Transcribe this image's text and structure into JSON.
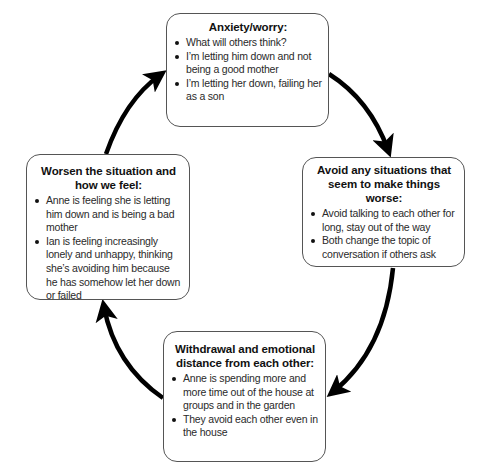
{
  "diagram": {
    "type": "cycle",
    "direction": "clockwise",
    "nodes": [
      {
        "id": "top",
        "title": "Anxiety/worry:",
        "bullets": [
          "What will others think?",
          "I’m letting him down and not being a good mother",
          "I’m letting her down, failing her as a son"
        ]
      },
      {
        "id": "right",
        "title": "Avoid any situations that seem to make things worse:",
        "bullets": [
          "Avoid talking to each other for long, stay out of the way",
          "Both change the topic of conversation if others ask"
        ]
      },
      {
        "id": "bottom",
        "title": "Withdrawal and emotional distance from each other:",
        "bullets": [
          "Anne is spending more and more time out of the house at groups and in the garden",
          "They avoid each other even in the house"
        ]
      },
      {
        "id": "left",
        "title": "Worsen the situation and how we feel:",
        "bullets": [
          "Anne is feeling she is letting him down and is being a bad mother",
          "Ian is feeling increasingly lonely and unhappy, thinking she’s avoiding him because he has somehow let her down or failed"
        ]
      }
    ],
    "edges": [
      {
        "from": "top",
        "to": "right"
      },
      {
        "from": "right",
        "to": "bottom"
      },
      {
        "from": "bottom",
        "to": "left"
      },
      {
        "from": "left",
        "to": "top"
      }
    ],
    "colors": {
      "arrow": "#000000",
      "box_border": "#555555",
      "background": "#ffffff"
    }
  }
}
